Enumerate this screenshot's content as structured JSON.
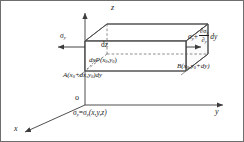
{
  "figure": {
    "type": "stress-element-diagram",
    "background": "#ffffff",
    "line_color": "#444444",
    "border_color": "#6e6e6e"
  },
  "axes": {
    "origin_label": "o",
    "z_label": "z",
    "y_label": "y",
    "x_label": "x"
  },
  "stress": {
    "left_label": "σ",
    "left_sub": "y",
    "right_base": "σ",
    "right_sub": "y",
    "right_plus": "+",
    "right_num": "∂σ",
    "right_num_sub": "y",
    "right_den": "∂",
    "right_den_sub": "y",
    "right_tail": "dy"
  },
  "dimensions": {
    "dz": "dz",
    "dx": "dx"
  },
  "points": {
    "p": "P(x",
    "p_sub1": "0",
    "p_mid": ",y",
    "p_sub2": "0",
    "p_end": ")",
    "a": "A(x",
    "a_sub1": "0",
    "a_mid": "+dx,y",
    "a_sub2": "0",
    "a_end": ")dy",
    "b": "B(x",
    "b_sub1": "0",
    "b_mid": ",y",
    "b_sub2": "0",
    "b_end": "+dy)"
  },
  "equation": {
    "lhs": "σ",
    "lhs_sub": "y",
    "eq": "=",
    "rhs": "σ",
    "rhs_sub": "y",
    "rhs_args": "(x,y,z)"
  }
}
